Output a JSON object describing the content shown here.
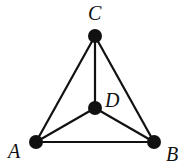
{
  "diagram": {
    "type": "graph",
    "nodes": [
      {
        "id": "A",
        "label": "A",
        "x": 36,
        "y": 142,
        "label_x": 8,
        "label_y": 158
      },
      {
        "id": "B",
        "label": "B",
        "x": 154,
        "y": 142,
        "label_x": 166,
        "label_y": 161
      },
      {
        "id": "C",
        "label": "C",
        "x": 95,
        "y": 36,
        "label_x": 88,
        "label_y": 20
      },
      {
        "id": "D",
        "label": "D",
        "x": 95,
        "y": 108,
        "label_x": 105,
        "label_y": 107
      }
    ],
    "edges": [
      {
        "from": "A",
        "to": "B"
      },
      {
        "from": "A",
        "to": "C"
      },
      {
        "from": "B",
        "to": "C"
      },
      {
        "from": "A",
        "to": "D"
      },
      {
        "from": "B",
        "to": "D"
      },
      {
        "from": "C",
        "to": "D"
      }
    ],
    "colors": {
      "stroke": "#111111",
      "node": "#111111",
      "background": "#ffffff"
    }
  }
}
